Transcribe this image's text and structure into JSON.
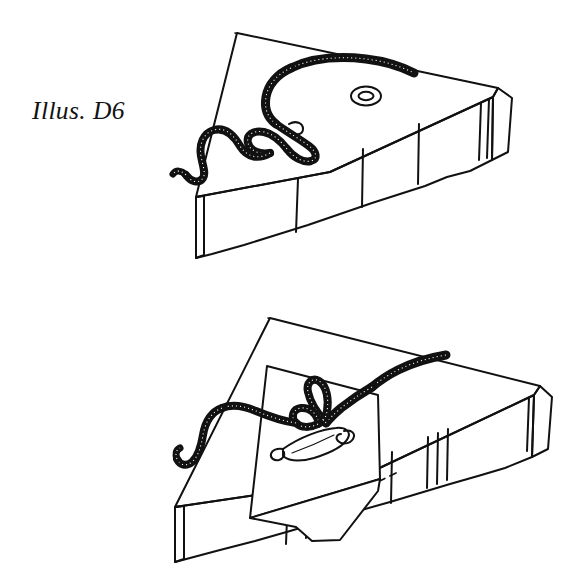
{
  "document": {
    "type": "instructional-line-drawing",
    "background_color": "#ffffff",
    "ink_color": "#111111",
    "panel_count": 2
  },
  "panels": [
    {
      "id": "d6",
      "caption": "Illus. D6",
      "caption_style": "italic-serif",
      "subject": "mattress corner with cord and grommet",
      "elements": [
        {
          "name": "mattress",
          "description": "box-shaped mattress in oblique projection, plain top face, stippled side panel with vertical tuft seams"
        },
        {
          "name": "cord",
          "description": "braided cord lying on mattress top, S-curved free end on the left, loose overhand knot at center, long tail running to the right"
        },
        {
          "name": "grommet",
          "description": "small double-outlined oval eyelet on the mattress top surface, right of the knot"
        },
        {
          "name": "back-edge-line",
          "description": "single thin receding line marking the far top edge of the mattress"
        }
      ]
    },
    {
      "id": "d7",
      "caption": "Illus. D7",
      "caption_style": "italic-serif",
      "subject": "mattress with cloth patch, knotted cord and safety pin",
      "elements": [
        {
          "name": "mattress",
          "description": "box-shaped mattress in oblique projection, stippled side panel with vertical tuft seams"
        },
        {
          "name": "cloth-patch",
          "description": "square fabric patch draped over the front top edge of the mattress, hanging down over the side"
        },
        {
          "name": "cord",
          "description": "braided cord with knot resting on the cloth patch, free end curving off to the left"
        },
        {
          "name": "safety-pin",
          "description": "open-style safety pin lying on the cloth patch below the knot, coil spring at the right end, clasp at the left end"
        },
        {
          "name": "hidden-edge",
          "description": "dashed line indicating the concealed mattress top edge beneath the cloth patch"
        }
      ]
    }
  ],
  "icons": {
    "grommet": "oval-eyelet-icon",
    "safety_pin": "safety-pin-icon",
    "cord": "braided-cord-icon"
  }
}
